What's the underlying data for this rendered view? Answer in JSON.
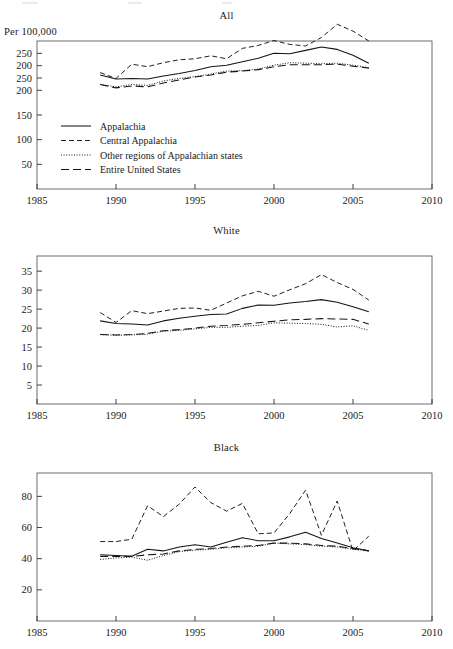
{
  "figure": {
    "axis_note": "Per 100,000",
    "x_axis": {
      "ticks": [
        1985,
        1990,
        1995,
        2000,
        2005,
        2010
      ],
      "labels": [
        "1985",
        "1990",
        "1995",
        "2000",
        "2005",
        "2010"
      ],
      "min": 1985,
      "max": 2010
    },
    "legend": {
      "items": [
        {
          "label": "Appalachia",
          "style": "solid"
        },
        {
          "label": "Central Appalachia",
          "style": "short-dash"
        },
        {
          "label": "Other regions of Appalachian states",
          "style": "dotted"
        },
        {
          "label": "Entire United States",
          "style": "long-dash"
        }
      ]
    }
  },
  "chart_data": [
    {
      "type": "line",
      "title": "All",
      "xlabel": "",
      "ylabel": "Per 100,000",
      "xlim": [
        1985,
        2010
      ],
      "ylim": [
        0,
        300
      ],
      "grid": false,
      "legend_position": "inside-lower-left",
      "ytick_labels": [
        "250",
        "200",
        "250",
        "200",
        "150",
        "100",
        "50"
      ],
      "ytick_values": [
        275,
        250,
        225,
        200,
        150,
        100,
        50
      ],
      "x": [
        1989,
        1990,
        1991,
        1992,
        1993,
        1994,
        1995,
        1996,
        1997,
        1998,
        1999,
        2000,
        2001,
        2002,
        2003,
        2004,
        2005,
        2006
      ],
      "series": [
        {
          "name": "Appalachia",
          "style": "solid",
          "values": [
            231,
            223,
            224,
            223,
            229,
            234,
            240,
            248,
            251,
            258,
            265,
            275,
            274,
            281,
            288,
            283,
            271,
            255
          ]
        },
        {
          "name": "Central Appalachia",
          "style": "short-dash",
          "values": [
            236,
            224,
            253,
            248,
            256,
            262,
            264,
            270,
            264,
            285,
            291,
            301,
            293,
            290,
            307,
            334,
            320,
            300,
            281
          ]
        },
        {
          "name": "Other regions of Appalachian states",
          "style": "dotted",
          "values": [
            212,
            207,
            212,
            210,
            219,
            224,
            228,
            233,
            239,
            240,
            243,
            251,
            256,
            255,
            254,
            255,
            251,
            246,
            233
          ]
        },
        {
          "name": "Entire United States",
          "style": "long-dash",
          "values": [
            212,
            205,
            209,
            207,
            215,
            221,
            227,
            231,
            237,
            239,
            242,
            248,
            252,
            252,
            252,
            253,
            249,
            245,
            232
          ]
        }
      ]
    },
    {
      "type": "line",
      "title": "White",
      "xlabel": "",
      "ylabel": "",
      "xlim": [
        1985,
        2010
      ],
      "ylim": [
        0,
        39
      ],
      "grid": false,
      "ytick_labels": [
        "35",
        "30",
        "25",
        "20",
        "15",
        "10",
        "5"
      ],
      "ytick_values": [
        35,
        30,
        25,
        20,
        15,
        10,
        5
      ],
      "x": [
        1989,
        1990,
        1991,
        1992,
        1993,
        1994,
        1995,
        1996,
        1997,
        1998,
        1999,
        2000,
        2001,
        2002,
        2003,
        2004,
        2005,
        2006
      ],
      "series": [
        {
          "name": "Appalachia",
          "style": "solid",
          "values": [
            21.9,
            21.2,
            21.1,
            20.8,
            21.9,
            22.6,
            23.1,
            23.6,
            23.7,
            25.2,
            26.1,
            26.0,
            26.6,
            27.0,
            27.5,
            26.8,
            25.6,
            24.3
          ]
        },
        {
          "name": "Central Appalachia",
          "style": "short-dash",
          "values": [
            24.1,
            21.5,
            24.6,
            23.8,
            24.5,
            25.2,
            25.3,
            24.7,
            26.6,
            28.5,
            29.7,
            28.4,
            30.1,
            31.7,
            34.1,
            32.0,
            30.2,
            27.4
          ]
        },
        {
          "name": "Other regions of Appalachian states",
          "style": "dotted",
          "values": [
            18.3,
            18.1,
            18.2,
            18.4,
            19.2,
            19.4,
            19.8,
            20.2,
            20.2,
            20.5,
            20.7,
            21.4,
            21.3,
            21.2,
            21.0,
            20.3,
            20.6,
            19.4
          ]
        },
        {
          "name": "Entire United States",
          "style": "long-dash",
          "values": [
            18.3,
            18.2,
            18.3,
            18.6,
            19.3,
            19.6,
            20.0,
            20.5,
            20.7,
            21.0,
            21.4,
            21.8,
            22.2,
            22.3,
            22.5,
            22.4,
            22.3,
            21.1
          ]
        }
      ]
    },
    {
      "type": "line",
      "title": "Black",
      "xlabel": "",
      "ylabel": "",
      "xlim": [
        1985,
        2010
      ],
      "ylim": [
        0,
        95
      ],
      "grid": false,
      "ytick_labels": [
        "80",
        "60",
        "40",
        "20"
      ],
      "ytick_values": [
        80,
        60,
        40,
        20
      ],
      "x": [
        1989,
        1990,
        1991,
        1992,
        1993,
        1994,
        1995,
        1996,
        1997,
        1998,
        1999,
        2000,
        2001,
        2002,
        2003,
        2004,
        2005,
        2006
      ],
      "series": [
        {
          "name": "Appalachia",
          "style": "solid",
          "values": [
            42.5,
            42.0,
            41.5,
            46.0,
            45.0,
            47.5,
            49.0,
            47.5,
            50.5,
            53.5,
            51.5,
            51.5,
            54.0,
            57.0,
            53.0,
            50.0,
            47.0,
            45.0
          ]
        },
        {
          "name": "Central Appalachia",
          "style": "short-dash",
          "values": [
            51.0,
            51.0,
            52.5,
            74.0,
            67.0,
            75.0,
            86.0,
            76.0,
            70.5,
            75.5,
            56.0,
            56.5,
            69.0,
            84.0,
            55.0,
            77.0,
            45.0,
            54.5
          ]
        },
        {
          "name": "Other regions of Appalachian states",
          "style": "dotted",
          "values": [
            39.5,
            40.5,
            41.0,
            39.0,
            42.0,
            44.5,
            45.5,
            46.0,
            47.0,
            47.5,
            48.0,
            50.0,
            49.5,
            49.0,
            48.0,
            47.5,
            46.0,
            45.0
          ]
        },
        {
          "name": "Entire United States",
          "style": "long-dash",
          "values": [
            41.5,
            41.5,
            41.5,
            42.5,
            43.0,
            45.0,
            46.0,
            46.5,
            47.5,
            48.0,
            48.5,
            50.0,
            50.0,
            49.5,
            48.5,
            48.0,
            46.5,
            45.0
          ]
        }
      ]
    }
  ]
}
